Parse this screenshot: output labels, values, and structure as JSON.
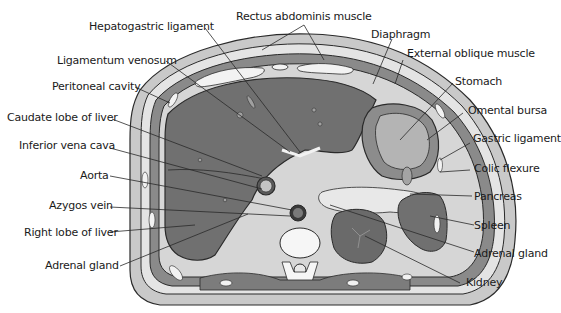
{
  "diagram": {
    "colors": {
      "background": "#ffffff",
      "organ_dark": "#6e6e6e",
      "organ_mid": "#9a9a9a",
      "tissue_light": "#d2d2d2",
      "skin": "#bdbdbd",
      "bone": "#f4f4f4",
      "outline": "#2a2a2a"
    },
    "labels_left": [
      {
        "id": "hepatogastric-ligament",
        "text": "Hepatogastric ligament"
      },
      {
        "id": "ligamentum-venosum",
        "text": "Ligamentum venosum"
      },
      {
        "id": "peritoneal-cavity",
        "text": "Peritoneal cavity"
      },
      {
        "id": "caudate-lobe",
        "text": "Caudate lobe of liver"
      },
      {
        "id": "inferior-vena-cava",
        "text": "Inferior vena cava"
      },
      {
        "id": "aorta",
        "text": "Aorta"
      },
      {
        "id": "azygos-vein",
        "text": "Azygos vein"
      },
      {
        "id": "right-lobe",
        "text": "Right lobe of liver"
      },
      {
        "id": "adrenal-gland-left",
        "text": "Adrenal gland"
      }
    ],
    "labels_top": [
      {
        "id": "rectus-abdominis",
        "text": "Rectus abdominis muscle"
      }
    ],
    "labels_right": [
      {
        "id": "diaphragm",
        "text": "Diaphragm"
      },
      {
        "id": "external-oblique",
        "text": "External oblique muscle"
      },
      {
        "id": "stomach",
        "text": "Stomach"
      },
      {
        "id": "omental-bursa",
        "text": "Omental bursa"
      },
      {
        "id": "gastric-ligament",
        "text": "Gastric ligament"
      },
      {
        "id": "colic-flexure",
        "text": "Colic flexure"
      },
      {
        "id": "pancreas",
        "text": "Pancreas"
      },
      {
        "id": "spleen",
        "text": "Spleen"
      },
      {
        "id": "adrenal-gland-right",
        "text": "Adrenal gland"
      },
      {
        "id": "kidney",
        "text": "Kidney"
      }
    ]
  }
}
